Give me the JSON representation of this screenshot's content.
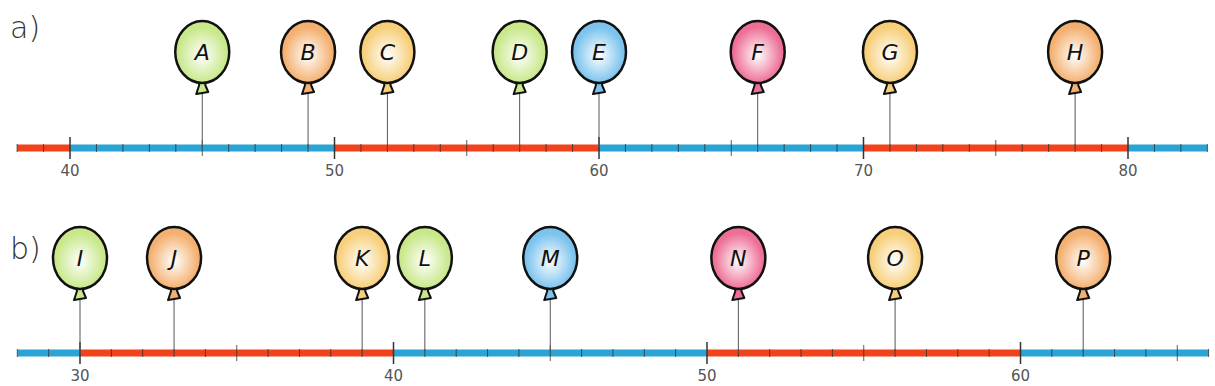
{
  "colors": {
    "red_segment": "#f2421c",
    "blue_segment": "#2aa4d4",
    "tick": "#333333",
    "string": "#555555",
    "balloon_outline": "#111111",
    "balloon_green": "#c8e88a",
    "balloon_orange": "#f4b070",
    "balloon_yellow": "#f7cf7a",
    "balloon_blue": "#7cc3ee",
    "balloon_pink": "#ee6f96"
  },
  "exercises": [
    {
      "label": "a)",
      "axis": {
        "min": 38,
        "max": 83,
        "major_step": 10,
        "minor_step": 1,
        "mid_step": 5
      },
      "tick_labels": [
        "40",
        "50",
        "60",
        "70",
        "80"
      ],
      "segments": [
        {
          "from": 38,
          "to": 40,
          "color": "red"
        },
        {
          "from": 40,
          "to": 50,
          "color": "blue"
        },
        {
          "from": 50,
          "to": 60,
          "color": "red"
        },
        {
          "from": 60,
          "to": 70,
          "color": "blue"
        },
        {
          "from": 70,
          "to": 80,
          "color": "red"
        },
        {
          "from": 80,
          "to": 83,
          "color": "blue"
        }
      ],
      "balloons": [
        {
          "letter": "A",
          "value": 45,
          "color": "green"
        },
        {
          "letter": "B",
          "value": 49,
          "color": "orange"
        },
        {
          "letter": "C",
          "value": 52,
          "color": "yellow"
        },
        {
          "letter": "D",
          "value": 57,
          "color": "green"
        },
        {
          "letter": "E",
          "value": 60,
          "color": "blue"
        },
        {
          "letter": "F",
          "value": 66,
          "color": "pink"
        },
        {
          "letter": "G",
          "value": 71,
          "color": "yellow"
        },
        {
          "letter": "H",
          "value": 78,
          "color": "orange"
        }
      ]
    },
    {
      "label": "b)",
      "axis": {
        "min": 28,
        "max": 66,
        "major_step": 10,
        "minor_step": 1,
        "mid_step": 5
      },
      "tick_labels": [
        "30",
        "40",
        "50",
        "60"
      ],
      "segments": [
        {
          "from": 28,
          "to": 30,
          "color": "blue"
        },
        {
          "from": 30,
          "to": 40,
          "color": "red"
        },
        {
          "from": 40,
          "to": 50,
          "color": "blue"
        },
        {
          "from": 50,
          "to": 60,
          "color": "red"
        },
        {
          "from": 60,
          "to": 66,
          "color": "blue"
        }
      ],
      "balloons": [
        {
          "letter": "I",
          "value": 30,
          "color": "green"
        },
        {
          "letter": "J",
          "value": 33,
          "color": "orange"
        },
        {
          "letter": "K",
          "value": 39,
          "color": "yellow"
        },
        {
          "letter": "L",
          "value": 41,
          "color": "green"
        },
        {
          "letter": "M",
          "value": 45,
          "color": "blue"
        },
        {
          "letter": "N",
          "value": 51,
          "color": "pink"
        },
        {
          "letter": "O",
          "value": 56,
          "color": "yellow"
        },
        {
          "letter": "P",
          "value": 62,
          "color": "orange"
        }
      ]
    }
  ],
  "chart_data": [
    {
      "type": "number-line",
      "title": "a)",
      "axis_range": [
        38,
        83
      ],
      "labeled_ticks": [
        40,
        50,
        60,
        70,
        80
      ],
      "points": [
        {
          "label": "A",
          "value": 45
        },
        {
          "label": "B",
          "value": 49
        },
        {
          "label": "C",
          "value": 52
        },
        {
          "label": "D",
          "value": 57
        },
        {
          "label": "E",
          "value": 60
        },
        {
          "label": "F",
          "value": 66
        },
        {
          "label": "G",
          "value": 71
        },
        {
          "label": "H",
          "value": 78
        }
      ]
    },
    {
      "type": "number-line",
      "title": "b)",
      "axis_range": [
        28,
        66
      ],
      "labeled_ticks": [
        30,
        40,
        50,
        60
      ],
      "points": [
        {
          "label": "I",
          "value": 30
        },
        {
          "label": "J",
          "value": 33
        },
        {
          "label": "K",
          "value": 39
        },
        {
          "label": "L",
          "value": 41
        },
        {
          "label": "M",
          "value": 45
        },
        {
          "label": "N",
          "value": 51
        },
        {
          "label": "O",
          "value": 56
        },
        {
          "label": "P",
          "value": 62
        }
      ]
    }
  ]
}
